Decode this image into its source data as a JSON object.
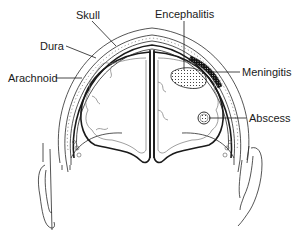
{
  "diagram": {
    "labels": {
      "skull": "Skull",
      "dura": "Dura",
      "arachnoid": "Arachnoid",
      "encephalitis": "Encephalitis",
      "meningitis": "Meningitis",
      "abscess": "Abscess"
    },
    "colors": {
      "line": "#1a1a1a",
      "background": "#ffffff",
      "lesion_fill": "#2a2a2a"
    }
  }
}
